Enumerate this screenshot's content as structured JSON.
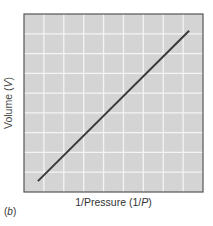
{
  "chart_data": {
    "type": "line",
    "title": "",
    "xlabel": "1/Pressure (1/P)",
    "ylabel": "Volume (V)",
    "xlabel_parts": {
      "pre": "1/Pressure (1/",
      "italic": "P",
      "post": ")"
    },
    "ylabel_parts": {
      "pre": "Volume (",
      "italic": "V",
      "post": ")"
    },
    "panel_label": {
      "pre": "(",
      "italic": "b",
      "post": ")"
    },
    "grid": true,
    "grid_divisions": {
      "x": 9,
      "y": 9
    },
    "xlim": [
      0,
      9
    ],
    "ylim": [
      0,
      9
    ],
    "tick_labels": {
      "x": [],
      "y": []
    },
    "legend": [],
    "series": [
      {
        "name": "V vs 1/P",
        "x": [
          0.7,
          8.3
        ],
        "y": [
          0.55,
          8.15
        ],
        "color": "#3a3a3a"
      }
    ],
    "colors": {
      "plot_background": "#d4d4d4",
      "grid": "#f4f4f4",
      "frame": "#555555",
      "line": "#3a3a3a"
    }
  }
}
